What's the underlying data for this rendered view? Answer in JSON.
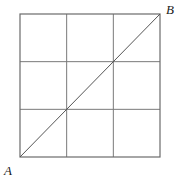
{
  "figure": {
    "background_color": "#ffffff",
    "square": {
      "x": 20,
      "y": 14,
      "width": 140,
      "height": 143,
      "border_color": "#6b6b6b",
      "border_width": 1.2
    },
    "grid": {
      "rows": 3,
      "columns": 3,
      "line_color": "#7a7a7a",
      "line_width": 1,
      "vertical_x": [
        66.67,
        113.33
      ],
      "horizontal_y": [
        61.67,
        109.33
      ]
    },
    "diagonal": {
      "from": "A",
      "to": "B",
      "x1": 20,
      "y1": 157,
      "x2": 160,
      "y2": 14,
      "color": "#555555",
      "width": 1
    },
    "labels": [
      {
        "id": "A",
        "text": "A",
        "x": 4,
        "y": 164,
        "style": "italic-serif"
      },
      {
        "id": "B",
        "text": "B",
        "x": 166,
        "y": 3,
        "style": "italic-serif"
      }
    ]
  }
}
